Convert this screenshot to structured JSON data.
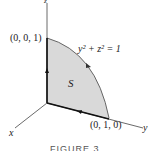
{
  "figure": {
    "caption": "FIGURE 3",
    "axes": {
      "x": "x",
      "y": "y",
      "z": "z"
    },
    "points": {
      "z_point": "(0, 0, 1)",
      "y_point": "(0, 1, 0)"
    },
    "curve_equation_lhs": "y",
    "curve_equation": "y² + z² = 1",
    "surface_label": "S",
    "colors": {
      "fill": "#d9d9d9",
      "axis": "#333333",
      "boundary": "#111111"
    }
  }
}
